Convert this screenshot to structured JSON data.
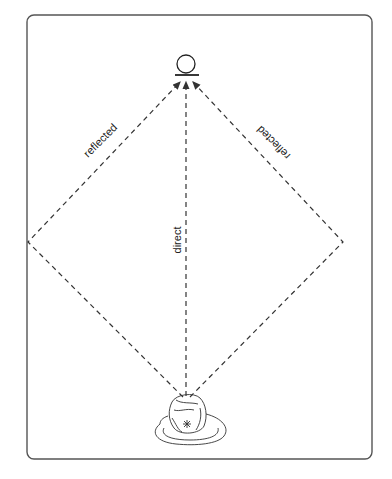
{
  "diagram": {
    "type": "sound-path-diagram",
    "labels": {
      "direct": "direct",
      "reflected_left": "reflected",
      "reflected_right": "reflected"
    },
    "elements": {
      "source": "microphone-or-source (circle on base)",
      "listener": "person seen from above"
    },
    "colors": {
      "line": "#333333",
      "frame": "#555555",
      "background": "#ffffff"
    }
  }
}
